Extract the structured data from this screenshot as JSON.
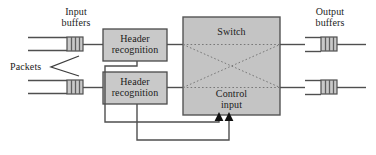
{
  "figure": {
    "kind": "block-diagram",
    "colors": {
      "box_fill": "#c9c9c9",
      "box_stroke": "#4a4a4a",
      "switch_fill": "#c4c4c4",
      "switch_stroke": "#555555",
      "line": "#4f4f4f",
      "text": "#1b1b1b",
      "buffer_stripe": "#6f6f6f",
      "background": "#ffffff"
    }
  },
  "labels": {
    "input_buffers": "Input\nbuffers",
    "input_buffers_line1": "Input",
    "input_buffers_line2": "buffers",
    "packets": "Packets",
    "output_buffers_line1": "Output",
    "output_buffers_line2": "buffers",
    "switch": "Switch",
    "control_input_line1": "Control",
    "control_input_line2": "input",
    "header_recognition_line1": "Header",
    "header_recognition_line2": "recognition"
  },
  "blocks": {
    "header_recognition_top": {
      "label_line1": "Header",
      "label_line2": "recognition",
      "x": 103,
      "y": 29,
      "w": 64,
      "h": 32
    },
    "header_recognition_bottom": {
      "label_line1": "Header",
      "label_line2": "recognition",
      "x": 103,
      "y": 72,
      "w": 64,
      "h": 32
    },
    "switch": {
      "label": "Switch",
      "control_label_line1": "Control",
      "control_label_line2": "input",
      "x": 183,
      "y": 17,
      "w": 97,
      "h": 98
    }
  },
  "buffers": {
    "input_top": {
      "x": 67,
      "y": 37,
      "w": 16,
      "h": 14,
      "stripes": 3
    },
    "input_bottom": {
      "x": 67,
      "y": 80,
      "w": 16,
      "h": 14,
      "stripes": 3
    },
    "output_top": {
      "x": 321,
      "y": 37,
      "w": 16,
      "h": 14,
      "stripes": 3
    },
    "output_bottom": {
      "x": 321,
      "y": 80,
      "w": 16,
      "h": 14,
      "stripes": 3
    }
  },
  "switch_paths": {
    "description": "dotted cross-connect lines inside switch",
    "count": 4
  },
  "control_arrows": {
    "count": 2,
    "x_positions": [
      219,
      229
    ],
    "tip_y": 115
  }
}
